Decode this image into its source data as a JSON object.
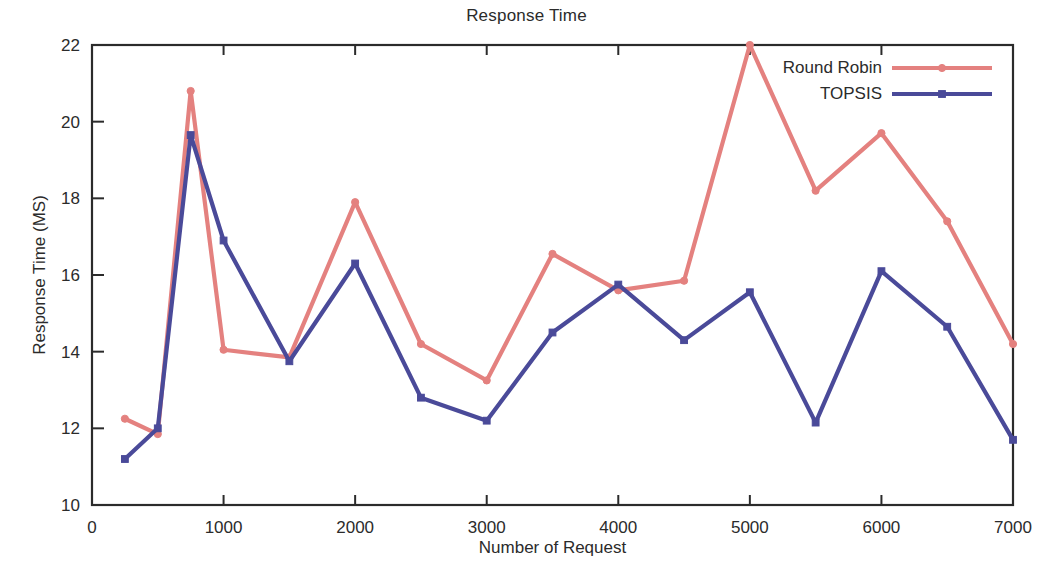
{
  "chart_data": {
    "type": "line",
    "title": "Response Time",
    "xlabel": "Number of Request",
    "ylabel": "Response Time (MS)",
    "xlim": [
      0,
      7000
    ],
    "ylim": [
      10,
      22
    ],
    "xticks": [
      0,
      1000,
      2000,
      3000,
      4000,
      5000,
      6000,
      7000
    ],
    "yticks": [
      10,
      12,
      14,
      16,
      18,
      20,
      22
    ],
    "grid": false,
    "legend_position": "top-right",
    "x": [
      250,
      500,
      750,
      1000,
      1500,
      2000,
      2500,
      3000,
      3500,
      4000,
      4500,
      5000,
      5500,
      6000,
      6500,
      7000
    ],
    "series": [
      {
        "name": "Round Robin",
        "color": "#e4817f",
        "marker": "circle",
        "values": [
          12.25,
          11.85,
          20.8,
          14.05,
          13.85,
          17.9,
          14.2,
          13.25,
          16.55,
          15.6,
          15.85,
          22.0,
          18.2,
          19.7,
          17.4,
          14.2
        ]
      },
      {
        "name": "TOPSIS",
        "color": "#4a4a99",
        "marker": "square",
        "values": [
          11.2,
          12.0,
          19.65,
          16.9,
          13.75,
          16.3,
          12.8,
          12.2,
          14.5,
          15.75,
          14.3,
          15.55,
          12.15,
          16.1,
          14.65,
          11.7
        ]
      }
    ]
  },
  "axis": {
    "x_tick_labels": [
      "0",
      "1000",
      "2000",
      "3000",
      "4000",
      "5000",
      "6000",
      "7000"
    ],
    "y_tick_labels": [
      "10",
      "12",
      "14",
      "16",
      "18",
      "20",
      "22"
    ]
  },
  "legend": {
    "entries": [
      {
        "label": "Round Robin"
      },
      {
        "label": "TOPSIS"
      }
    ]
  },
  "colors": {
    "round_robin": "#e4817f",
    "topsis": "#4a4a99",
    "axis": "#2b2b2b",
    "background": "#ffffff"
  }
}
